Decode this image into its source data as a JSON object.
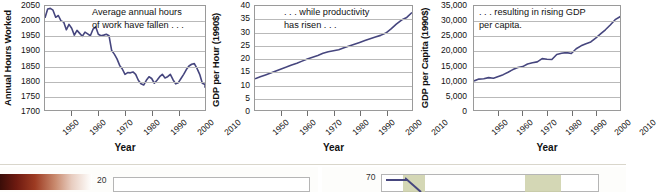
{
  "figure": {
    "name": "three-panel-trend-figure",
    "line_color": "#46467e",
    "grid_color": "#b9b9b9",
    "axis_color": "#9a9a9a"
  },
  "charts": [
    {
      "id": "annual-hours-worked",
      "type": "line",
      "title": "",
      "annotation_lines": [
        "Average annual hours",
        "of work have fallen . . ."
      ],
      "ylabel": "Annual Hours Worked",
      "xlabel": "Year",
      "ylim": [
        1700,
        2050
      ],
      "yticks": [
        2050,
        2000,
        1950,
        1900,
        1850,
        1800,
        1750,
        1700
      ],
      "yticklabels": [
        "2050",
        "2000",
        "1950",
        "1900",
        "1850",
        "1800",
        "1750",
        "1700"
      ],
      "xlim": [
        1950,
        2010
      ],
      "xticks": [
        1950,
        1960,
        1970,
        1980,
        1990,
        2000,
        2010
      ],
      "xticklabels": [
        "1950",
        "1960",
        "1970",
        "1980",
        "1990",
        "2000",
        "2010"
      ],
      "x": [
        1950,
        1951,
        1952,
        1953,
        1954,
        1955,
        1956,
        1957,
        1958,
        1959,
        1960,
        1961,
        1962,
        1963,
        1964,
        1965,
        1966,
        1967,
        1968,
        1969,
        1970,
        1971,
        1972,
        1973,
        1974,
        1975,
        1976,
        1977,
        1978,
        1979,
        1980,
        1981,
        1982,
        1983,
        1984,
        1985,
        1986,
        1987,
        1988,
        1989,
        1990,
        1991,
        1992,
        1993,
        1994,
        1995,
        1996,
        1997,
        1998,
        1999,
        2000,
        2001,
        2002,
        2003,
        2004,
        2005,
        2006,
        2007,
        2008,
        2009,
        2010
      ],
      "y": [
        2010,
        2040,
        2042,
        2036,
        2012,
        2018,
        2000,
        1996,
        1970,
        1988,
        1975,
        1952,
        1968,
        1958,
        1948,
        1962,
        1956,
        1950,
        1972,
        1980,
        1955,
        1950,
        1952,
        1955,
        1950,
        1900,
        1888,
        1872,
        1850,
        1838,
        1820,
        1826,
        1825,
        1828,
        1820,
        1800,
        1788,
        1784,
        1800,
        1812,
        1806,
        1790,
        1800,
        1812,
        1820,
        1808,
        1812,
        1820,
        1802,
        1788,
        1792,
        1806,
        1820,
        1836,
        1848,
        1854,
        1856,
        1840,
        1820,
        1790,
        1786
      ],
      "y_end": 1775
    },
    {
      "id": "gdp-per-hour",
      "type": "line",
      "title": "",
      "annotation_lines": [
        ". . . while productivity",
        "has risen . . ."
      ],
      "ylabel": "GDP per Hour (1990$)",
      "xlabel": "Year",
      "ylim": [
        0,
        40
      ],
      "yticks": [
        40,
        35,
        30,
        25,
        20,
        15,
        10,
        5,
        0
      ],
      "yticklabels": [
        "40",
        "35",
        "30",
        "25",
        "20",
        "15",
        "10",
        "5",
        "0"
      ],
      "xlim": [
        1950,
        2010
      ],
      "xticks": [
        1950,
        1960,
        1970,
        1980,
        1990,
        2000,
        2010
      ],
      "xticklabels": [
        "1950",
        "1960",
        "1970",
        "1980",
        "1990",
        "2000",
        "2010"
      ],
      "x": [
        1950,
        1952,
        1954,
        1956,
        1958,
        1960,
        1962,
        1964,
        1966,
        1968,
        1970,
        1972,
        1974,
        1976,
        1978,
        1980,
        1982,
        1984,
        1986,
        1988,
        1990,
        1992,
        1994,
        1996,
        1998,
        2000,
        2002,
        2004,
        2006,
        2008,
        2010
      ],
      "y": [
        12.0,
        12.8,
        13.5,
        14.2,
        15.0,
        15.8,
        16.5,
        17.3,
        18.0,
        18.8,
        19.6,
        20.3,
        21.0,
        21.8,
        22.4,
        22.8,
        23.2,
        23.9,
        24.6,
        25.3,
        26.0,
        26.7,
        27.4,
        28.1,
        28.7,
        29.6,
        31.2,
        33.0,
        34.6,
        35.6,
        37.5
      ]
    },
    {
      "id": "gdp-per-capita",
      "type": "line",
      "title": "",
      "annotation_lines": [
        ". . . resulting in rising GDP",
        "per capita."
      ],
      "ylabel": "GDP per Capita (1990$)",
      "xlabel": "Year",
      "ylim": [
        0,
        35000
      ],
      "yticks": [
        35000,
        30000,
        25000,
        20000,
        15000,
        10000,
        5000,
        0
      ],
      "yticklabels": [
        "35,000",
        "30,000",
        "25,000",
        "20,000",
        "15,000",
        "10,000",
        "5,000",
        "0"
      ],
      "xlim": [
        1950,
        2010
      ],
      "xticks": [
        1950,
        1960,
        1970,
        1980,
        1990,
        2000,
        2010
      ],
      "xticklabels": [
        "1950",
        "1960",
        "1970",
        "1980",
        "1990",
        "2000",
        "2010"
      ],
      "x": [
        1950,
        1952,
        1954,
        1956,
        1958,
        1960,
        1962,
        1964,
        1966,
        1968,
        1970,
        1972,
        1974,
        1976,
        1978,
        1980,
        1982,
        1984,
        1986,
        1988,
        1990,
        1992,
        1994,
        1996,
        1998,
        2000,
        2002,
        2004,
        2006,
        2008,
        2010
      ],
      "y": [
        9800,
        10400,
        10500,
        10900,
        10700,
        11300,
        11900,
        12700,
        13600,
        14300,
        14600,
        15500,
        15900,
        16200,
        17300,
        17100,
        17000,
        18700,
        19100,
        19300,
        19000,
        20600,
        21600,
        22300,
        22900,
        24200,
        25600,
        27000,
        28600,
        30400,
        31400
      ],
      "y_end": 31200
    }
  ],
  "bottom_strip": {
    "name": "cropped-next-figure-strip",
    "left_axis_value": "20",
    "right_axis_value": "70",
    "gradient_name": "dark-red-to-white-gradient",
    "band_color": "#cdd0a8",
    "line_color": "#46467e"
  }
}
